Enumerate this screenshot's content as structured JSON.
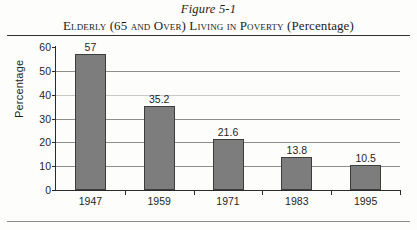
{
  "figure": {
    "number": "Figure 5-1",
    "caption_smallcaps": "Elderly (65 and Over) Living in Poverty",
    "caption_normal": "(Percentage)"
  },
  "chart_data": {
    "type": "bar",
    "categories": [
      "1947",
      "1959",
      "1971",
      "1983",
      "1995"
    ],
    "values": [
      57,
      35.2,
      21.6,
      13.8,
      10.5
    ],
    "value_labels": [
      "57",
      "35.2",
      "21.6",
      "13.8",
      "10.5"
    ],
    "xlabel": "",
    "ylabel": "Percentage",
    "ylim": [
      0,
      60
    ],
    "yticks": [
      0,
      10,
      20,
      30,
      40,
      50,
      60
    ],
    "ytick_labels": [
      "0",
      "10",
      "20",
      "30",
      "40",
      "50",
      "60"
    ],
    "grid": true,
    "legend": false,
    "bar_color": "#7d7d7d",
    "bar_edge_color": "#3d3d3d"
  }
}
